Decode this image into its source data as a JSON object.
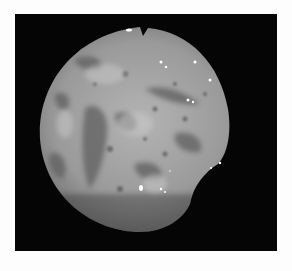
{
  "image": {
    "description": "Grayscale endoscopic view of mucosal tissue within a circular field on a black background",
    "colors": {
      "background": "#fdfdfd",
      "frame": "#050505",
      "tissue_light": "#b8b8b8",
      "tissue_mid": "#8a8a8a",
      "tissue_dark": "#4a4a4a",
      "highlight": "#ffffff"
    }
  }
}
